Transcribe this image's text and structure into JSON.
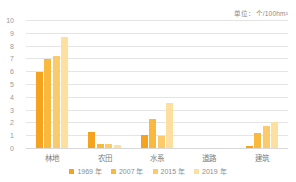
{
  "chart_data": {
    "type": "bar",
    "title": "",
    "subtitle": "",
    "unit_label": "单位：个/100hm²",
    "xlabel": "",
    "ylabel": "",
    "ylim": [
      0,
      10
    ],
    "ytick_labels": [
      "10",
      "9",
      "8",
      "7",
      "6",
      "5",
      "4",
      "3",
      "2",
      "1",
      "0"
    ],
    "yticks": [
      10,
      9,
      8,
      7,
      6,
      5,
      4,
      3,
      2,
      1,
      0
    ],
    "grid": true,
    "legend_position": "bottom-center",
    "categories": [
      "林地",
      "农田",
      "水系",
      "道路",
      "建筑"
    ],
    "series": [
      {
        "name": "1969 年",
        "color": "#F5A21E",
        "values": [
          5.95,
          1.25,
          1.0,
          0.0,
          0.15
        ]
      },
      {
        "name": "2007 年",
        "color": "#F9B93F",
        "values": [
          6.95,
          0.3,
          2.3,
          0.0,
          1.2
        ]
      },
      {
        "name": "2015 年",
        "color": "#FBCB6B",
        "values": [
          7.15,
          0.35,
          0.9,
          0.0,
          1.7
        ]
      },
      {
        "name": "2019 年",
        "color": "#FDE0A0",
        "values": [
          8.7,
          0.2,
          3.55,
          0.0,
          2.05
        ]
      }
    ]
  },
  "colors": {
    "background": "#ffffff",
    "gridline": "#e4e4e4",
    "baseline": "#d8d8d8",
    "tick_text": "#9a9a9a",
    "label_text": "#7d7d7d",
    "caption_text": "#8a8a8a"
  }
}
